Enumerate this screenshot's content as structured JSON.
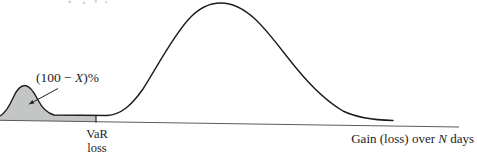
{
  "figure": {
    "labels": {
      "tail": {
        "pre": "(100 − ",
        "x": "X",
        "post": ")%"
      },
      "var": {
        "line1": "VaR",
        "line2": "loss"
      },
      "gain": {
        "pre": "Gain (loss) over ",
        "n": "N",
        "post": " days"
      }
    },
    "colors": {
      "curve": "#1c1c1c",
      "shade": "#c3c6c4",
      "axis": "#4a4a4a",
      "annotation": "#222222",
      "background": "#ffffff"
    }
  }
}
